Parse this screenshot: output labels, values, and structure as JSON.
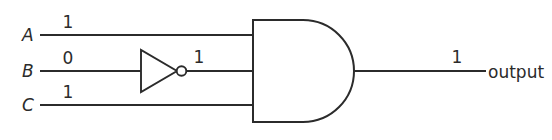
{
  "diagram": {
    "background_color": "#ffffff",
    "stroke_color": "#2b2b2b",
    "width": 552,
    "height": 140
  },
  "inputs": [
    {
      "label": "A",
      "value": "1"
    },
    {
      "label": "B",
      "value": "0"
    },
    {
      "label": "C",
      "value": "1"
    }
  ],
  "gates": {
    "inverter": {
      "name": "NOT",
      "input_signal": "0",
      "output_value": "1"
    },
    "and_gate": {
      "name": "AND",
      "inputs": 3
    }
  },
  "output": {
    "value": "1",
    "label": "output"
  }
}
